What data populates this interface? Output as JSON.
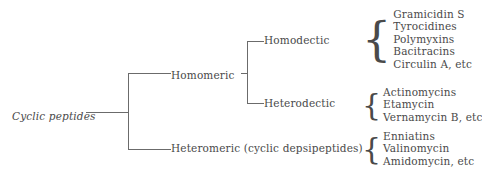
{
  "diagram": {
    "type": "taxonomy-tree",
    "root": {
      "label": "Cyclic peptides",
      "style": "italic"
    },
    "nodes": {
      "homomeric": "Homomeric",
      "heteromeric": "Heteromeric (cyclic depsipeptides)",
      "homodectic": "Homodectic",
      "heterodectic": "Heterodectic"
    },
    "leaves": {
      "homodectic": [
        "Gramicidin S",
        "Tyrocidines",
        "Polymyxins",
        "Bacitracins",
        "Circulin A, etc"
      ],
      "heterodectic": [
        "Actinomycins",
        "Etamycin",
        "Vernamycin B, etc"
      ],
      "heteromeric": [
        "Enniatins",
        "Valinomycin",
        "Amidomycin, etc"
      ]
    },
    "brace_glyph": "{",
    "colors": {
      "ink": "#4a4a4a",
      "rule": "#6b6b6b",
      "background": "#ffffff"
    }
  }
}
